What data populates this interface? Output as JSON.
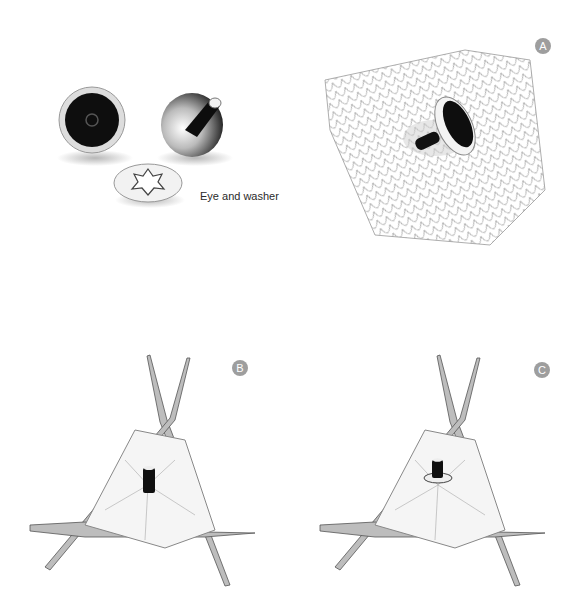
{
  "figure": {
    "caption_eye": "Eye and washer",
    "badges": {
      "a": "A",
      "b": "B",
      "c": "C"
    },
    "colors": {
      "badge": "#9e9e9e",
      "needle": "#b8b8b8",
      "yarn_stroke": "#8a8a8a",
      "eye": "#111111"
    }
  }
}
